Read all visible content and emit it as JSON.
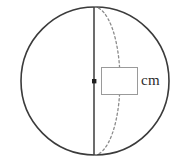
{
  "figure": {
    "name": "sphere-diameter-diagram",
    "shape": "sphere",
    "background_color": "#ffffff",
    "outline_color": "#3b3b3b",
    "dashed_color": "#8c8c8c",
    "box_border_color": "#9a9a9a",
    "circle": {
      "center_x": 95,
      "center_y": 81,
      "radius": 74
    },
    "equator_ellipse": {
      "description": "dashed arc showing the front half of the great circle",
      "rx": 26,
      "ry": 74
    },
    "diameter_line": {
      "description": "solid vertical diameter from top pole to bottom pole",
      "x": 94,
      "y_top": 7,
      "y_bottom": 155
    },
    "center_point": {
      "x": 94,
      "y": 81,
      "size": 4
    }
  },
  "measurement": {
    "answer_value": "",
    "answer_placeholder": "",
    "unit_label": "cm"
  }
}
